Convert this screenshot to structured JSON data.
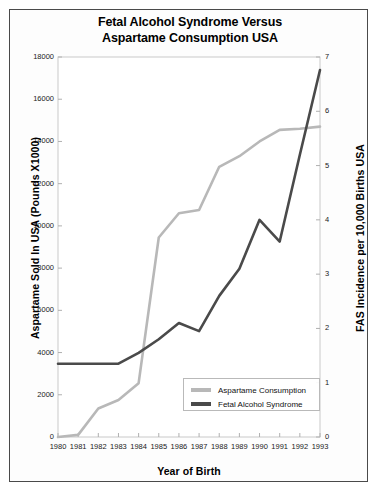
{
  "chart_data": {
    "type": "line",
    "title": "Fetal Alcohol Syndrome Versus Aspartame Consumption USA",
    "title_line1": "Fetal Alcohol Syndrome Versus",
    "title_line2": "Aspartame Consumption USA",
    "xlabel": "Year of Birth",
    "ylabel": "Aspartame Sold In USA (Pounds X1000)",
    "ylabel_right": "FAS Incidence per 10,000 Births USA",
    "grid": false,
    "legend_position": "lower right",
    "categories": [
      "1980",
      "1981",
      "1982",
      "1983",
      "1984",
      "1985",
      "1986",
      "1987",
      "1988",
      "1989",
      "1990",
      "1991",
      "1992",
      "1993"
    ],
    "x": [
      1980,
      1981,
      1982,
      1983,
      1984,
      1985,
      1986,
      1987,
      1988,
      1989,
      1990,
      1991,
      1992,
      1993
    ],
    "xlim": [
      1980,
      1993
    ],
    "ylim": [
      0,
      18000
    ],
    "ylim_right": [
      0,
      7
    ],
    "ytick_labels": [
      "0",
      "2000",
      "4000",
      "6000",
      "8000",
      "10000",
      "12000",
      "14000",
      "16000",
      "18000"
    ],
    "ytick_values": [
      0,
      2000,
      4000,
      6000,
      8000,
      10000,
      12000,
      14000,
      16000,
      18000
    ],
    "ytick_right_labels": [
      "0",
      "1",
      "2",
      "3",
      "4",
      "5",
      "6",
      "7"
    ],
    "ytick_right_values": [
      0,
      1,
      2,
      3,
      4,
      5,
      6,
      7
    ],
    "series": [
      {
        "name": "Aspartame Consumption",
        "axis": "left",
        "color": "#b8b8b8",
        "values": [
          0,
          100,
          1350,
          1750,
          2550,
          9450,
          10600,
          10750,
          12800,
          13300,
          14000,
          14550,
          14600,
          14700
        ]
      },
      {
        "name": "Fetal Alcohol Syndrome",
        "axis": "right",
        "color": "#4a4a4a",
        "values": [
          1.35,
          1.35,
          1.35,
          1.35,
          1.55,
          1.8,
          2.1,
          1.95,
          2.6,
          3.1,
          4.0,
          3.6,
          5.2,
          6.76
        ]
      }
    ],
    "legend": [
      {
        "label": "Aspartame Consumption",
        "color": "#b8b8b8"
      },
      {
        "label": "Fetal Alcohol Syndrome",
        "color": "#4a4a4a"
      }
    ],
    "colors": {
      "aspartame": "#b8b8b8",
      "fas": "#4a4a4a",
      "frame": "#4a4a4a",
      "plot_border": "#c9c9c9",
      "background": "#ffffff"
    }
  }
}
